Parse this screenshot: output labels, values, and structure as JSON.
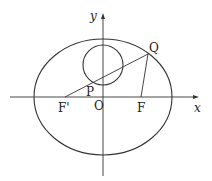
{
  "diagram": {
    "type": "geometry",
    "axes": {
      "x_label": "x",
      "y_label": "y",
      "origin_label": "O"
    },
    "points": {
      "F_prime": "F'",
      "F": "F",
      "P": "P",
      "Q": "Q",
      "O": "O"
    },
    "colors": {
      "stroke": "#333333",
      "background": "#ffffff"
    }
  }
}
